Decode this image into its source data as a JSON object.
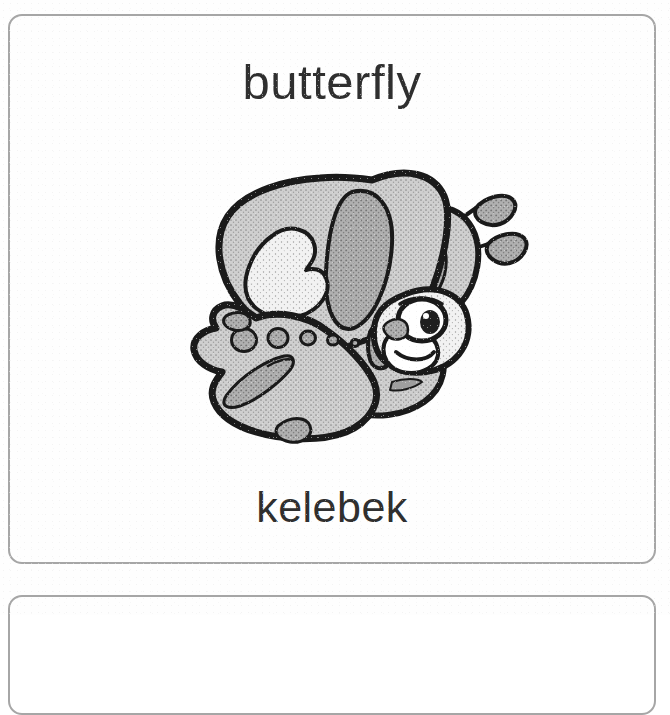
{
  "page": {
    "background_color": "#ffffff",
    "type": "printed-vocabulary-flashcard-sheet"
  },
  "cards": [
    {
      "id": "card-butterfly",
      "english_word": "butterfly",
      "turkish_word": "kelebek",
      "illustration": {
        "name": "butterfly-illustration",
        "description": "cartoon butterfly drawing, grey stippled wings with black outline, clubbed antennae, smiling face with one large eye",
        "style": "black-and-white line art with halftone grey fill",
        "spot_count": 5
      },
      "border_color": "#a6a6a6",
      "text_color": "#2f2f2f"
    },
    {
      "id": "card-next",
      "english_word": "",
      "turkish_word": "",
      "border_color": "#a6a6a6"
    }
  ],
  "palette": {
    "ink_black": "#1a1a1a",
    "wing_grey": "#c9c9c9",
    "wing_grey_dark": "#a8a8a8",
    "wing_highlight": "#efefef",
    "paper_white": "#ffffff",
    "card_border": "#a6a6a6",
    "text": "#2f2f2f"
  }
}
